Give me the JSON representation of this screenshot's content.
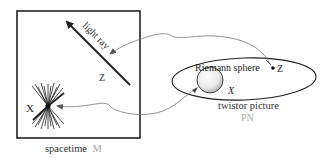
{
  "diagram": {
    "spacetime": {
      "label": "spacetime",
      "symbol": "M",
      "point_label": "X",
      "ray_label": "light ray",
      "ray_point_label": "Z"
    },
    "twistor": {
      "label": "twistor picture",
      "symbol": "PN",
      "sphere_label": "Riemann sphere",
      "sphere_point_label": "X",
      "point_label": "Z"
    },
    "colors": {
      "ink": "#222222",
      "symbol_gray": "#aaaaaa",
      "connector": "#888888"
    }
  }
}
